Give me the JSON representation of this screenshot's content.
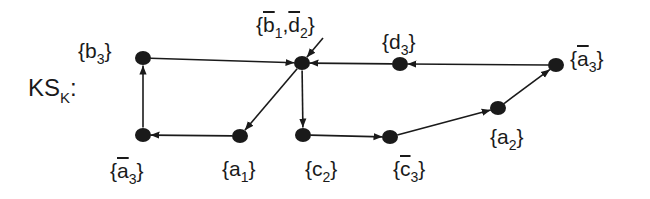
{
  "diagram": {
    "title": {
      "main": "KS",
      "sub": "K",
      "suffix": ":"
    },
    "colors": {
      "ink": "#1a1a1a",
      "background": "#ffffff"
    },
    "nodes": [
      {
        "id": "b3",
        "x": 143,
        "y": 58,
        "label": {
          "prefix": "{",
          "base": "b",
          "sub": "3",
          "suffix": "}",
          "bar": false
        },
        "label_pos": [
          78,
          40
        ]
      },
      {
        "id": "abar3_l",
        "x": 143,
        "y": 135,
        "label": {
          "prefix": "{",
          "base": "a",
          "sub": "3",
          "suffix": "}",
          "bar": true
        },
        "label_pos": [
          110,
          160
        ]
      },
      {
        "id": "b1d2",
        "x": 302,
        "y": 63,
        "label": {
          "text": "{b̄₁,d̄₂}"
        },
        "label_pos": [
          255,
          12
        ]
      },
      {
        "id": "a1",
        "x": 240,
        "y": 136,
        "label": {
          "prefix": "{",
          "base": "a",
          "sub": "1",
          "suffix": "}",
          "bar": false
        },
        "label_pos": [
          222,
          158
        ]
      },
      {
        "id": "c2",
        "x": 303,
        "y": 135,
        "label": {
          "prefix": "{",
          "base": "c",
          "sub": "2",
          "suffix": "}",
          "bar": false
        },
        "label_pos": [
          305,
          158
        ]
      },
      {
        "id": "cbar3",
        "x": 390,
        "y": 137,
        "label": {
          "prefix": "{",
          "base": "c",
          "sub": "3",
          "suffix": "}",
          "bar": true
        },
        "label_pos": [
          393,
          158
        ]
      },
      {
        "id": "d3",
        "x": 400,
        "y": 64,
        "label": {
          "prefix": "{",
          "base": "d",
          "sub": "3",
          "suffix": "}",
          "bar": false
        },
        "label_pos": [
          382,
          30
        ]
      },
      {
        "id": "a2",
        "x": 498,
        "y": 108,
        "label": {
          "prefix": "{",
          "base": "a",
          "sub": "2",
          "suffix": "}",
          "bar": false
        },
        "label_pos": [
          490,
          126
        ]
      },
      {
        "id": "abar3_r",
        "x": 556,
        "y": 65,
        "label": {
          "prefix": "{",
          "base": "a",
          "sub": "3",
          "suffix": "}",
          "bar": true
        },
        "label_pos": [
          570,
          48
        ]
      }
    ],
    "edges": [
      {
        "from": "abar3_l",
        "to": "b3"
      },
      {
        "from": "b3",
        "to": "b1d2"
      },
      {
        "from": "b1d2",
        "to": "a1"
      },
      {
        "from": "a1",
        "to": "abar3_l"
      },
      {
        "from": "b1d2",
        "to": "c2"
      },
      {
        "from": "c2",
        "to": "cbar3"
      },
      {
        "from": "cbar3",
        "to": "a2"
      },
      {
        "from": "a2",
        "to": "abar3_r"
      },
      {
        "from": "abar3_r",
        "to": "d3"
      },
      {
        "from": "d3",
        "to": "b1d2"
      }
    ],
    "initial_state": {
      "node": "b1d2",
      "from": [
        323,
        38
      ]
    },
    "labels": {
      "b3": {
        "open": "{",
        "base": "b",
        "sub": "3",
        "close": "}"
      },
      "abar3_l": {
        "open": "{",
        "base": "a",
        "sub": "3",
        "close": "}"
      },
      "b1d2": {
        "open": "{",
        "b": "b",
        "b_sub": "1",
        "sep": ",",
        "d": "d",
        "d_sub": "2",
        "close": "}"
      },
      "a1": {
        "open": "{",
        "base": "a",
        "sub": "1",
        "close": "}"
      },
      "c2": {
        "open": "{",
        "base": "c",
        "sub": "2",
        "close": "}"
      },
      "cbar3": {
        "open": "{",
        "base": "c",
        "sub": "3",
        "close": "}"
      },
      "d3": {
        "open": "{",
        "base": "d",
        "sub": "3",
        "close": "}"
      },
      "a2": {
        "open": "{",
        "base": "a",
        "sub": "2",
        "close": "}"
      },
      "abar3_r": {
        "open": "{",
        "base": "a",
        "sub": "3",
        "close": "}"
      }
    }
  }
}
